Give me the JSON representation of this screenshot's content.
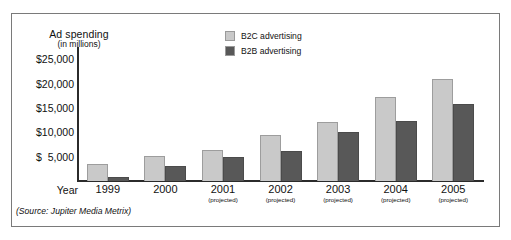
{
  "figure": {
    "axis_title_line1": "Ad spending",
    "axis_title_line2": "(in millions)",
    "year_axis_label": "Year",
    "source_note": "(Source: Jupiter Media Metrix)"
  },
  "legend": {
    "items": [
      {
        "label": "B2C advertising",
        "color": "#c9c9c9"
      },
      {
        "label": "B2B advertising",
        "color": "#585858"
      }
    ]
  },
  "axis": {
    "y_ticks": [
      "$25,000",
      "$20,000",
      "$15,000",
      "$10,000",
      "$  5,000"
    ],
    "x_years": [
      "1999",
      "2000",
      "2001",
      "2002",
      "2003",
      "2004",
      "2005"
    ],
    "x_notes": [
      "",
      "",
      "(projected)",
      "(projected)",
      "(projected)",
      "(projected)",
      "(projected)"
    ]
  },
  "chart_data": {
    "type": "bar",
    "title": "Ad spending (in millions)",
    "xlabel": "Year",
    "ylabel": "Ad spending (in millions)",
    "categories": [
      "1999",
      "2000",
      "2001",
      "2002",
      "2003",
      "2004",
      "2005"
    ],
    "category_notes": [
      "",
      "",
      "projected",
      "projected",
      "projected",
      "projected",
      "projected"
    ],
    "series": [
      {
        "name": "B2C advertising",
        "color": "#c9c9c9",
        "values": [
          3500,
          5200,
          6300,
          9400,
          12100,
          17300,
          20900
        ]
      },
      {
        "name": "B2B advertising",
        "color": "#585858",
        "values": [
          800,
          3000,
          5000,
          6200,
          10000,
          12300,
          15900
        ]
      }
    ],
    "ylim": [
      0,
      27500
    ],
    "ytick_values": [
      25000,
      20000,
      15000,
      10000,
      5000
    ],
    "grid": false,
    "legend_position": "top-center",
    "source": "Jupiter Media Metrix"
  }
}
